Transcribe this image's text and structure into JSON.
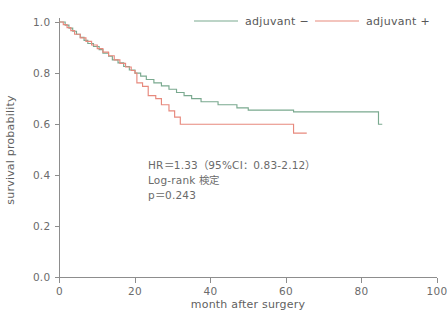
{
  "chart_data": {
    "type": "line",
    "subtype": "kaplan-meier-step",
    "title": "",
    "xlabel": "month after surgery",
    "ylabel": "survival probability",
    "xlim": [
      0,
      100
    ],
    "ylim": [
      0.0,
      1.0
    ],
    "xticks": [
      0,
      20,
      40,
      60,
      80,
      100
    ],
    "xtick_labels": [
      "0",
      "20",
      "40",
      "60",
      "80",
      "100"
    ],
    "yticks": [
      0.0,
      0.2,
      0.4,
      0.6,
      0.8,
      1.0
    ],
    "ytick_labels": [
      "0.0",
      "0.2",
      "0.4",
      "0.6",
      "0.8",
      "1.0"
    ],
    "grid": false,
    "legend_position": "top-right",
    "series": [
      {
        "name": "adjuvant −",
        "color": "#7aa98f",
        "steps": [
          [
            0,
            1.0
          ],
          [
            1.5,
            0.988
          ],
          [
            2.5,
            0.976
          ],
          [
            3.5,
            0.964
          ],
          [
            4.5,
            0.952
          ],
          [
            5.5,
            0.94
          ],
          [
            6.5,
            0.928
          ],
          [
            7.5,
            0.916
          ],
          [
            9.0,
            0.904
          ],
          [
            10.5,
            0.892
          ],
          [
            11.5,
            0.878
          ],
          [
            13.0,
            0.866
          ],
          [
            14.0,
            0.852
          ],
          [
            15.5,
            0.84
          ],
          [
            17.0,
            0.826
          ],
          [
            18.5,
            0.812
          ],
          [
            20.0,
            0.8
          ],
          [
            21.5,
            0.788
          ],
          [
            23.0,
            0.775
          ],
          [
            25.0,
            0.762
          ],
          [
            27.0,
            0.75
          ],
          [
            29.0,
            0.737
          ],
          [
            31.0,
            0.724
          ],
          [
            33.0,
            0.712
          ],
          [
            35.0,
            0.7
          ],
          [
            37.5,
            0.688
          ],
          [
            40.0,
            0.688
          ],
          [
            42.0,
            0.676
          ],
          [
            45.0,
            0.676
          ],
          [
            47.0,
            0.664
          ],
          [
            50.0,
            0.655
          ],
          [
            57.0,
            0.655
          ],
          [
            62.0,
            0.648
          ],
          [
            84.5,
            0.648
          ],
          [
            84.5,
            0.6
          ],
          [
            85.5,
            0.6
          ]
        ]
      },
      {
        "name": "adjuvant +",
        "color": "#e7897d",
        "steps": [
          [
            0,
            1.0
          ],
          [
            1.0,
            0.99
          ],
          [
            2.0,
            0.978
          ],
          [
            3.0,
            0.966
          ],
          [
            4.0,
            0.952
          ],
          [
            5.5,
            0.938
          ],
          [
            7.0,
            0.924
          ],
          [
            8.5,
            0.91
          ],
          [
            10.0,
            0.896
          ],
          [
            11.5,
            0.882
          ],
          [
            13.0,
            0.868
          ],
          [
            14.5,
            0.852
          ],
          [
            16.0,
            0.838
          ],
          [
            17.5,
            0.824
          ],
          [
            19.0,
            0.81
          ],
          [
            20.0,
            0.8
          ],
          [
            20.5,
            0.762
          ],
          [
            22.0,
            0.748
          ],
          [
            23.5,
            0.712
          ],
          [
            25.5,
            0.7
          ],
          [
            27.0,
            0.676
          ],
          [
            29.0,
            0.652
          ],
          [
            30.5,
            0.628
          ],
          [
            32.0,
            0.6
          ],
          [
            45.0,
            0.6
          ],
          [
            45.5,
            0.6
          ],
          [
            62.0,
            0.6
          ],
          [
            62.0,
            0.565
          ],
          [
            65.5,
            0.565
          ]
        ]
      }
    ],
    "annotation": {
      "line1": "HR＝1.33（95%CI：0.83-2.12）",
      "line2": "Log-rank 検定",
      "line3": "p＝0.243"
    }
  },
  "legend": {
    "entries": [
      {
        "label": "adjuvant −",
        "color": "#7aa98f"
      },
      {
        "label": "adjuvant +",
        "color": "#e7897d"
      }
    ]
  },
  "colors": {
    "adjuvant_minus": "#7aa98f",
    "adjuvant_plus": "#e7897d",
    "axis": "#8d8d8d",
    "text": "#5f5f5f",
    "background": "#ffffff"
  }
}
